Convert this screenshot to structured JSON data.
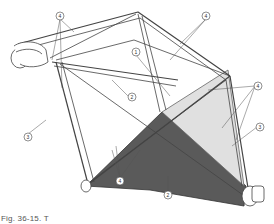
{
  "figure": {
    "colors": {
      "line": "#444444",
      "panel_dark": "#555555",
      "panel_light": "#dcdcdc",
      "tube_fill": "#ffffff",
      "background": "#ffffff"
    },
    "callouts": [
      {
        "id": "c4a",
        "label": "4",
        "x": 60,
        "y": 16
      },
      {
        "id": "c4b",
        "label": "4",
        "x": 206,
        "y": 16
      },
      {
        "id": "c1",
        "label": "1",
        "x": 136,
        "y": 52
      },
      {
        "id": "c2a",
        "label": "2",
        "x": 132,
        "y": 97
      },
      {
        "id": "c3a",
        "label": "3",
        "x": 28,
        "y": 137
      },
      {
        "id": "c4c",
        "label": "4",
        "x": 258,
        "y": 86
      },
      {
        "id": "c3b",
        "label": "3",
        "x": 260,
        "y": 127
      },
      {
        "id": "c4d",
        "label": "4",
        "x": 120,
        "y": 181
      },
      {
        "id": "c2b",
        "label": "2",
        "x": 168,
        "y": 195
      }
    ]
  },
  "caption": {
    "text": "Fig. 36-15. T"
  }
}
